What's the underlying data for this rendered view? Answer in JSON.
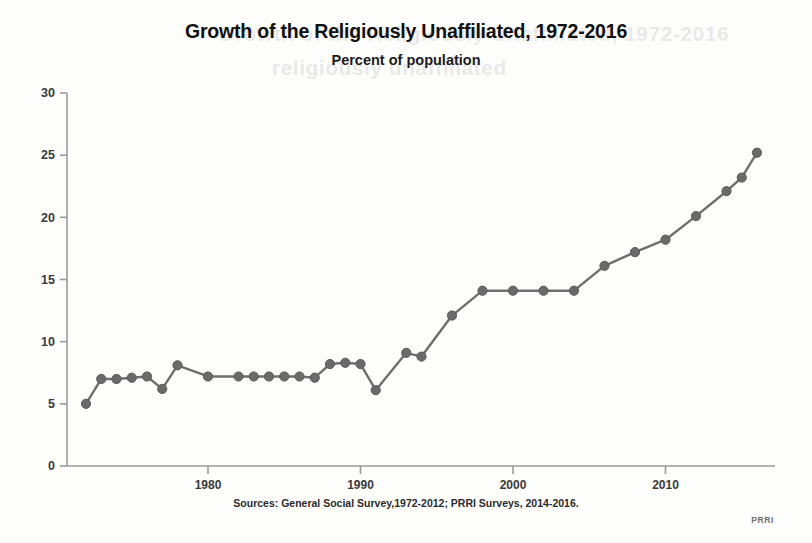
{
  "chart_data": {
    "type": "line",
    "title": "Growth of the Religiously Unaffiliated, 1972-2016",
    "subtitle": "Percent of population",
    "xlabel": "",
    "ylabel": "",
    "source": "Sources: General Social Survey,1972-2012; PRRI Surveys, 2014-2016.",
    "watermark": "PRRI",
    "grid": false,
    "legend": "none",
    "xlim": [
      1971,
      2017
    ],
    "ylim": [
      0,
      30
    ],
    "ytick_labels": [
      "30",
      "25",
      "20",
      "15",
      "10",
      "5",
      "0"
    ],
    "yticks": [
      30,
      25,
      20,
      15,
      10,
      5,
      0
    ],
    "xtick_labels": [
      "1980",
      "1990",
      "2000",
      "2010"
    ],
    "xticks": [
      1980,
      1990,
      2000,
      2010
    ],
    "series": [
      {
        "name": "Religiously unaffiliated",
        "color": "#6a6a6a",
        "x": [
          1972,
          1973,
          1974,
          1975,
          1976,
          1977,
          1978,
          1980,
          1982,
          1983,
          1984,
          1985,
          1986,
          1987,
          1988,
          1989,
          1990,
          1991,
          1993,
          1994,
          1996,
          1998,
          2000,
          2002,
          2004,
          2006,
          2008,
          2010,
          2012,
          2014,
          2015,
          2016
        ],
        "values": [
          5.0,
          7.0,
          7.0,
          7.1,
          7.2,
          6.2,
          8.1,
          7.2,
          7.2,
          7.2,
          7.2,
          7.2,
          7.2,
          7.1,
          8.2,
          8.3,
          8.2,
          6.1,
          9.1,
          8.8,
          12.1,
          14.1,
          14.1,
          14.1,
          14.1,
          16.1,
          17.2,
          18.2,
          20.1,
          22.1,
          23.2,
          25.2
        ]
      }
    ]
  },
  "ghost": {
    "line1": "Growth of the Religiously Unaffiliated, 1972-2016",
    "line2": "religiously unaffiliated",
    "line3": ""
  }
}
